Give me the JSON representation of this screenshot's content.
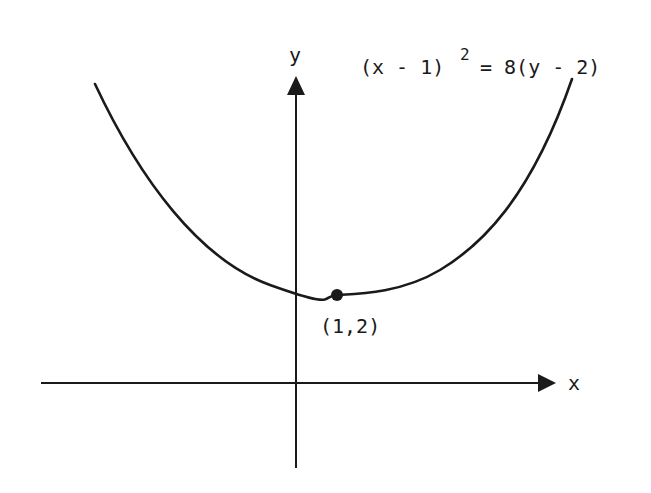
{
  "diagram": {
    "equation": {
      "left": "(x - 1)",
      "exponent": "2",
      "right": "= 8(y - 2)"
    },
    "axes": {
      "x_label": "x",
      "y_label": "y"
    },
    "vertex": {
      "label": "(1,2)",
      "x": 1,
      "y": 2
    },
    "colors": {
      "stroke": "#1a1a1a",
      "background": "#ffffff"
    }
  }
}
